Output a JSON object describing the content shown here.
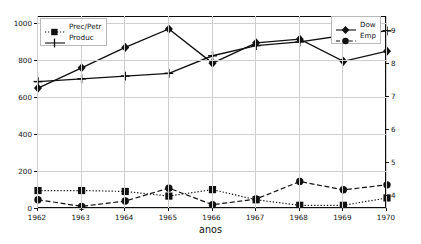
{
  "chart_data": {
    "type": "line",
    "title": "",
    "xlabel": "anos",
    "ylabel": "",
    "grid": true,
    "categories": [
      "1962",
      "1963",
      "1964",
      "1965",
      "1966",
      "1967",
      "1968",
      "1969",
      "1970"
    ],
    "x": [
      1962,
      1963,
      1964,
      1965,
      1966,
      1967,
      1968,
      1969,
      1970
    ],
    "left_axis": {
      "ylim": [
        0,
        1040
      ],
      "ticks": [
        0,
        200,
        400,
        600,
        800,
        1000
      ],
      "tick_labels": [
        "0",
        "200",
        "400",
        "600",
        "800",
        "1000"
      ]
    },
    "right_axis": {
      "ylim": [
        3.62,
        9.42
      ],
      "ticks": [
        4,
        5,
        6,
        7,
        8,
        9
      ],
      "tick_labels": [
        "4",
        "5",
        "6",
        "7",
        "8",
        "9"
      ]
    },
    "series": [
      {
        "name": "Prec/Petr",
        "axis": "left",
        "marker": "square",
        "linestyle": "dotted",
        "color": "#111111",
        "values": [
          100,
          100,
          95,
          70,
          105,
          50,
          20,
          20,
          60
        ]
      },
      {
        "name": "Produc",
        "axis": "left",
        "marker": "plus",
        "linestyle": "solid",
        "color": "#111111",
        "values": [
          690,
          705,
          720,
          735,
          830,
          885,
          905,
          940,
          965
        ]
      },
      {
        "name": "Dow",
        "axis": "left",
        "marker": "diamond",
        "linestyle": "solid",
        "color": "#111111",
        "values": [
          655,
          765,
          875,
          975,
          790,
          900,
          920,
          800,
          855
        ]
      },
      {
        "name": "Emp",
        "axis": "right",
        "marker": "circle",
        "linestyle": "dashed",
        "color": "#111111",
        "values": [
          3.9,
          3.7,
          3.86,
          4.25,
          3.75,
          3.92,
          4.45,
          4.2,
          4.35
        ]
      }
    ],
    "legends": [
      {
        "position": "upper-left",
        "entries": [
          "Prec/Petr",
          "Produc"
        ]
      },
      {
        "position": "upper-right",
        "entries": [
          "Dow",
          "Emp"
        ]
      }
    ]
  },
  "legend_left": {
    "entry_0": "Prec/Petr",
    "entry_1": "Produc"
  },
  "legend_right": {
    "entry_0": "Dow",
    "entry_1": "Emp"
  },
  "axis": {
    "xlabel": "anos",
    "left_ticks": [
      "0",
      "200",
      "400",
      "600",
      "800",
      "1000"
    ],
    "right_ticks": [
      "4",
      "5",
      "6",
      "7",
      "8",
      "9"
    ],
    "x_ticks": [
      "1962",
      "1963",
      "1964",
      "1965",
      "1966",
      "1967",
      "1968",
      "1969",
      "1970"
    ]
  }
}
